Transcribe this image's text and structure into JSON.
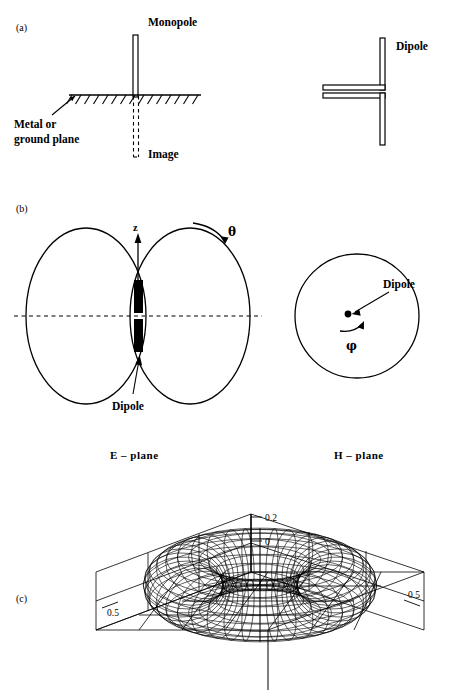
{
  "page": {
    "header_fragment": "",
    "width": 452,
    "height": 697,
    "ink_color": "#000000",
    "background_color": "#ffffff"
  },
  "panels": {
    "a": {
      "marker": "(a)"
    },
    "b": {
      "marker": "(b)"
    },
    "c": {
      "marker": "(c)"
    }
  },
  "panel_a": {
    "monopole_label": "Monopole",
    "ground_plane_label_line1": "Metal or",
    "ground_plane_label_line2": "ground plane",
    "image_label": "Image",
    "dipole_label": "Dipole"
  },
  "panel_b": {
    "z_axis_label": "z",
    "theta_label": "θ",
    "phi_label": "φ",
    "dipole_label_e": "Dipole",
    "dipole_label_h": "Dipole",
    "e_plane_caption": "E – plane",
    "h_plane_caption": "H – plane"
  },
  "chart_data": {
    "type": "line",
    "title": "",
    "subtitle": "",
    "projection": "3d-isometric-wireframe",
    "surface": "toroidal-doughnut",
    "grid": true,
    "legend": null,
    "axes": [
      {
        "name": "z",
        "orientation": "vertical",
        "tick_labels": [
          "0.2",
          "0"
        ],
        "tick_values": [
          0.2,
          0
        ],
        "range": [
          0,
          0.2
        ]
      },
      {
        "name": "x",
        "orientation": "left-depth",
        "tick_labels": [
          "0.5"
        ],
        "tick_values": [
          0.5
        ],
        "range": [
          -0.5,
          0.5
        ]
      },
      {
        "name": "y",
        "orientation": "right-depth",
        "tick_labels": [
          "0.5"
        ],
        "tick_values": [
          0.5
        ],
        "range": [
          -0.5,
          0.5
        ]
      }
    ],
    "mesh": {
      "major_radius": 0.33,
      "minor_radius": 0.17,
      "u_divisions": 40,
      "v_divisions": 22
    },
    "xlabel": "",
    "ylabel": "",
    "zlabel": ""
  }
}
